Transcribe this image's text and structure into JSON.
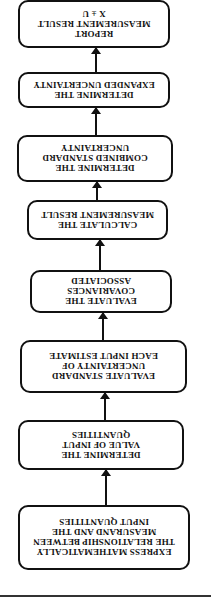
{
  "diagram": {
    "orientation": "rotated-180",
    "steps": [
      {
        "lines": [
          "EXPRESS MATHEMATICALLY",
          "THE RELATIONSHIP BETWEEN",
          "MEASURAND AND THE",
          "INPUT QUANTITIES"
        ]
      },
      {
        "lines": [
          "DETERMINE THE",
          "VALUE OF INPUT",
          "QUANTITIES"
        ]
      },
      {
        "lines": [
          "EVALUATE STANDARD",
          "UNCERTAINTY OF",
          "EACH INPUT ESTIMATE"
        ]
      },
      {
        "lines": [
          "EVALUATE THE",
          "COVARIANCES",
          "ASSOCIATED"
        ]
      },
      {
        "lines": [
          "CALCULATE THE",
          "MEASUREMENT RESULT"
        ]
      },
      {
        "lines": [
          "DETERMINE THE",
          "COMBINED STANDARD",
          "UNCERTAINTY"
        ]
      },
      {
        "lines": [
          "DETERMINE THE",
          "EXPANDED UNCERTAINTY"
        ]
      },
      {
        "lines": [
          "REPORT",
          "MEASUREMENT RESULT",
          "X ± U"
        ]
      }
    ]
  }
}
